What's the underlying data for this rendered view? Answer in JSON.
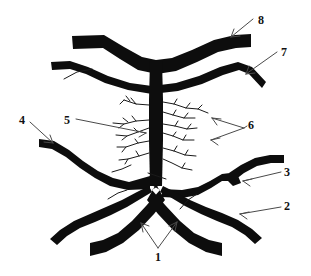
{
  "figure": {
    "background_color": "#ffffff",
    "ink_color": "#0d0d0d",
    "leader_color": "#4a4a4a",
    "width": 311,
    "height": 276
  },
  "callouts": [
    {
      "id": "callout-1",
      "label": "1",
      "x": 155,
      "y": 251,
      "arrows": 2,
      "direction": "up-left and up-right"
    },
    {
      "id": "callout-2",
      "label": "2",
      "x": 284,
      "y": 200,
      "arrows": 1,
      "direction": "left"
    },
    {
      "id": "callout-3",
      "label": "3",
      "x": 284,
      "y": 166,
      "arrows": 1,
      "direction": "left"
    },
    {
      "id": "callout-4",
      "label": "4",
      "x": 19,
      "y": 114,
      "arrows": 1,
      "direction": "down-right"
    },
    {
      "id": "callout-5",
      "label": "5",
      "x": 64,
      "y": 114,
      "arrows": 1,
      "direction": "right"
    },
    {
      "id": "callout-6",
      "label": "6",
      "x": 248,
      "y": 119,
      "arrows": 2,
      "direction": "left"
    },
    {
      "id": "callout-7",
      "label": "7",
      "x": 281,
      "y": 46,
      "arrows": 1,
      "direction": "down-left"
    },
    {
      "id": "callout-8",
      "label": "8",
      "x": 258,
      "y": 14,
      "arrows": 1,
      "direction": "down-left"
    }
  ]
}
